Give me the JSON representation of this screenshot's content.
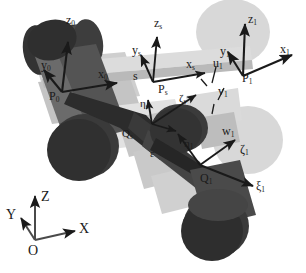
{
  "figure": {
    "type": "technical-diagram",
    "background_color": "#ffffff",
    "ink_color": "#1a1a1a",
    "palette": {
      "cylinder_dark": "#3b3b3b",
      "cylinder_mid": "#6e6e6e",
      "cylinder_face": "#454545",
      "plate_light": "#d2d2d2",
      "plate_lighter": "#e2e2e2",
      "plate_mid": "#b3b3b3",
      "disc_light": "#d8d8d8",
      "beam_gray": "#c9c9c9",
      "arm_dark": "#2e2e2e"
    }
  },
  "global_frame": {
    "origin": "O",
    "x_axis": "X",
    "y_axis": "Y",
    "z_axis": "Z"
  },
  "frame_0": {
    "origin": "P",
    "origin_sub": "0",
    "x_axis": "x",
    "x_sub": "0",
    "y_axis": "y",
    "y_sub": "0",
    "z_axis": "z",
    "z_sub": "0"
  },
  "frame_s": {
    "origin": "P",
    "origin_sub": "s",
    "x_axis": "x",
    "x_sub": "s",
    "y_axis": "y",
    "y_sub": "s",
    "z_axis": "z",
    "z_sub": "s",
    "greek_origin": "Q",
    "greek_origin_sub": "s",
    "xi": "ξ",
    "xi_sub": "s",
    "eta": "η",
    "eta_sub": "s",
    "zeta": "ζ",
    "zeta_sub": "s"
  },
  "frame_1": {
    "origin": "P",
    "origin_sub": "1",
    "x_axis": "x",
    "x_sub": "1",
    "y_axis": "y",
    "y_sub": "1",
    "z_axis": "z",
    "z_sub": "1",
    "greek_origin": "Q",
    "greek_origin_sub": "1",
    "xi": "ξ",
    "xi_sub": "1",
    "eta": "η",
    "eta_sub": "1",
    "zeta": "ζ",
    "zeta_sub": "1"
  },
  "annotations": {
    "s_length": "s",
    "u1": "u",
    "u1_sub": "1",
    "v1": "v",
    "v1_sub": "1",
    "w1": "w",
    "w1_sub": "1",
    "epsilon": "ε"
  }
}
